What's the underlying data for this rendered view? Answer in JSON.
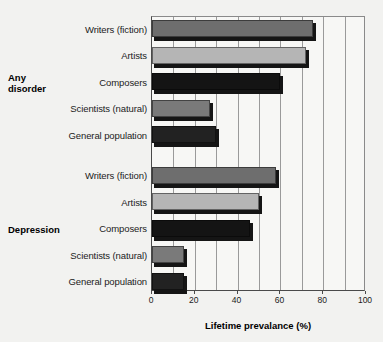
{
  "chart_data": {
    "type": "bar",
    "orientation": "horizontal",
    "title": "",
    "xlabel": "Lifetime prevalance (%)",
    "ylabel": "",
    "xlim": [
      0,
      100
    ],
    "xticks": [
      0,
      20,
      40,
      60,
      80,
      100
    ],
    "xtick_labels": [
      "0",
      "20",
      "40",
      "60",
      "80",
      "100"
    ],
    "gridlines_every": 10,
    "grid": true,
    "legend": "none",
    "groups": [
      {
        "label": "Any disorder",
        "label_lines": [
          "Any",
          "disorder"
        ],
        "categories": [
          "Writers (fiction)",
          "Artists",
          "Composers",
          "Scientists (natural)",
          "General population"
        ],
        "values": [
          75,
          72,
          60,
          27,
          30
        ],
        "colors": [
          "#6e6e6e",
          "#b5b5b5",
          "#141414",
          "#7a7a7a",
          "#222222"
        ]
      },
      {
        "label": "Depression",
        "label_lines": [
          "Depression"
        ],
        "categories": [
          "Writers (fiction)",
          "Artists",
          "Composers",
          "Scientists (natural)",
          "General population"
        ],
        "values": [
          58,
          50,
          46,
          15,
          15
        ],
        "colors": [
          "#6e6e6e",
          "#b5b5b5",
          "#141414",
          "#7a7a7a",
          "#222222"
        ]
      }
    ]
  },
  "figure": {
    "background_color": "#f2f2f0",
    "plot_background_color": "#f7f7f5",
    "axis_color": "#4a4a4a",
    "gridline_color": "#9a9a9a"
  }
}
